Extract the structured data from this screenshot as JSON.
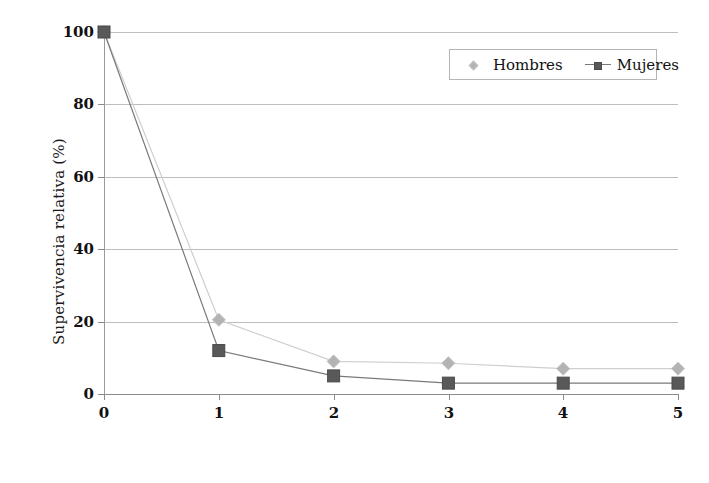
{
  "chart_data": {
    "type": "line",
    "title": "",
    "subtitle": "",
    "xlabel": "Años desde el diagnóstico",
    "ylabel": "Supervivencia relativa (%)",
    "x": [
      0,
      1,
      2,
      3,
      4,
      5
    ],
    "xticklabels": [
      "0",
      "1",
      "2",
      "3",
      "4",
      "5"
    ],
    "yticklabels": [
      "0",
      "20",
      "40",
      "60",
      "80",
      "100"
    ],
    "yticks": [
      0,
      20,
      40,
      60,
      80,
      100
    ],
    "xlim": [
      0,
      5
    ],
    "ylim": [
      0,
      100
    ],
    "grid": "horizontal",
    "legend_position": "top-right",
    "series": [
      {
        "name": "Hombres",
        "values": [
          100,
          20.5,
          9,
          8.5,
          7,
          7
        ],
        "color": "#b3b3b3",
        "line_color": "#cfcfcf",
        "marker": "diamond"
      },
      {
        "name": "Mujeres",
        "values": [
          100,
          12,
          5,
          3,
          3,
          3
        ],
        "color": "#595959",
        "line_color": "#7a7a7a",
        "marker": "square"
      }
    ]
  },
  "legend": {
    "entries": [
      {
        "label": "Hombres"
      },
      {
        "label": "Mujeres"
      }
    ]
  }
}
